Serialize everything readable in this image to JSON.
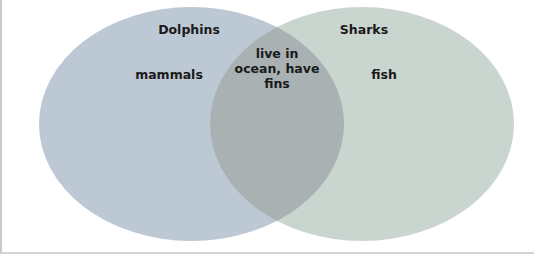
{
  "diagram": {
    "type": "venn",
    "sets": [
      {
        "id": "left",
        "title": "Dolphins",
        "unique_label": "mammals",
        "color": "#bcc8d3"
      },
      {
        "id": "right",
        "title": "Sharks",
        "unique_label": "fish",
        "color": "#c9d5cf"
      }
    ],
    "overlap": {
      "lines": [
        "live in",
        "ocean, have",
        "fins"
      ],
      "color": "#a9b1b3"
    }
  }
}
